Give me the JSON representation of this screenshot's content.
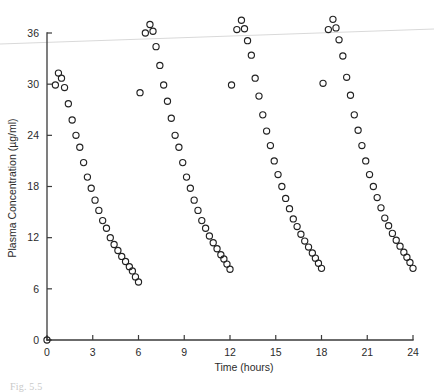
{
  "figure": {
    "caption_partial": "Fig. 5.5"
  },
  "chart_data": {
    "type": "scatter",
    "title": "",
    "xlabel": "Time (hours)",
    "ylabel": "Plasma Concentration (µg/ml)",
    "xlim": [
      0,
      24
    ],
    "ylim": [
      0,
      36
    ],
    "xticks": [
      0,
      3,
      6,
      9,
      12,
      15,
      18,
      21,
      24
    ],
    "yticks": [
      0,
      6,
      12,
      18,
      24,
      30,
      36
    ],
    "xticklabels": [
      "0",
      "3",
      "6",
      "9",
      "12",
      "15",
      "18",
      "21",
      "24"
    ],
    "yticklabels": [
      "0",
      "6",
      "12",
      "18",
      "24",
      "30",
      "36"
    ],
    "grid": false,
    "legend": false,
    "marker": "open-circle",
    "marker_color": "#222222",
    "marker_radius_px": 3.1,
    "dosing_interval_hours": 6,
    "series": [
      {
        "name": "Plasma concentration",
        "x": [
          0.0,
          0.55,
          0.75,
          0.95,
          1.15,
          1.4,
          1.65,
          1.9,
          2.15,
          2.4,
          2.65,
          2.9,
          3.15,
          3.4,
          3.65,
          3.9,
          4.15,
          4.4,
          4.65,
          4.9,
          5.15,
          5.4,
          5.6,
          5.8,
          6.0,
          6.1,
          6.45,
          6.75,
          6.95,
          7.15,
          7.4,
          7.65,
          7.9,
          8.15,
          8.4,
          8.65,
          8.9,
          9.15,
          9.4,
          9.65,
          9.9,
          10.15,
          10.4,
          10.65,
          10.9,
          11.15,
          11.4,
          11.6,
          11.8,
          12.0,
          12.1,
          12.45,
          12.75,
          12.95,
          13.15,
          13.4,
          13.65,
          13.9,
          14.15,
          14.4,
          14.65,
          14.9,
          15.15,
          15.4,
          15.65,
          15.9,
          16.15,
          16.4,
          16.65,
          16.9,
          17.15,
          17.4,
          17.6,
          17.8,
          18.0,
          18.1,
          18.45,
          18.75,
          18.95,
          19.15,
          19.4,
          19.65,
          19.9,
          20.15,
          20.4,
          20.65,
          20.9,
          21.15,
          21.4,
          21.65,
          21.9,
          22.15,
          22.4,
          22.65,
          22.9,
          23.15,
          23.4,
          23.6,
          23.8,
          24.0
        ],
        "y": [
          0.0,
          29.9,
          31.3,
          30.7,
          29.6,
          27.7,
          25.8,
          24.0,
          22.6,
          20.8,
          19.1,
          17.8,
          16.4,
          15.2,
          14.0,
          13.1,
          12.0,
          11.2,
          10.5,
          9.8,
          9.2,
          8.6,
          8.1,
          7.4,
          6.8,
          29.0,
          36.0,
          37.0,
          36.2,
          34.4,
          32.2,
          29.9,
          28.0,
          26.0,
          24.0,
          22.6,
          20.8,
          19.1,
          17.8,
          16.4,
          15.2,
          14.0,
          13.1,
          12.2,
          11.4,
          10.7,
          10.0,
          9.5,
          8.9,
          8.3,
          29.9,
          36.4,
          37.5,
          36.5,
          35.1,
          33.4,
          30.7,
          28.6,
          26.4,
          24.5,
          22.8,
          21.0,
          19.4,
          18.0,
          16.6,
          15.4,
          14.2,
          13.3,
          12.4,
          11.6,
          10.9,
          10.2,
          9.6,
          9.0,
          8.4,
          30.1,
          36.4,
          37.6,
          36.6,
          35.2,
          33.3,
          30.8,
          28.7,
          26.4,
          24.6,
          22.8,
          21.0,
          19.4,
          18.0,
          16.7,
          15.5,
          14.3,
          13.4,
          12.5,
          11.7,
          11.0,
          10.3,
          9.7,
          9.1,
          8.4
        ]
      }
    ]
  }
}
